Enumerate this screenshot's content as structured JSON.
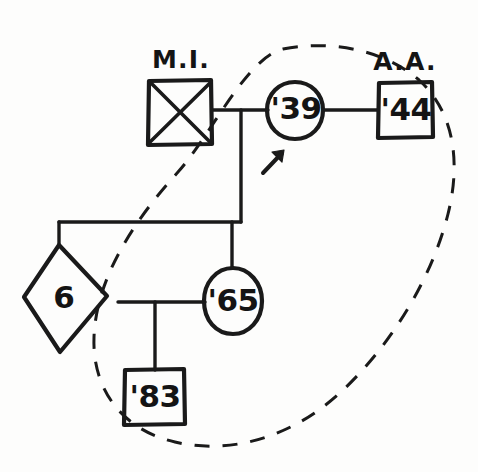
{
  "diagram": {
    "style": "hand-drawn ink on white paper",
    "background_color": "#fdfdfc",
    "ink_color": "#1a1a1a"
  },
  "individuals": [
    {
      "id": "deceased-male",
      "shape": "square",
      "sex": "male",
      "status": "deceased",
      "marker": "diagonal-cross",
      "inner_text": "",
      "annotation": "M.I.",
      "annotation_meaning": "myocardial infarction",
      "generation": 1
    },
    {
      "id": "proband-female",
      "shape": "circle",
      "sex": "female",
      "status": "living",
      "inner_text": "'39",
      "annotation": "",
      "proband": true,
      "proband_marker": "arrow",
      "generation": 1
    },
    {
      "id": "male-44",
      "shape": "square",
      "sex": "male",
      "status": "living",
      "inner_text": "'44",
      "annotation": "A.A.",
      "annotation_meaning": "alcohol abuse",
      "generation": 1
    },
    {
      "id": "unknown-sex-6",
      "shape": "diamond",
      "sex": "unknown",
      "status": "living",
      "inner_text": "6",
      "inner_text_meaning": "number of individuals represented",
      "annotation": "",
      "generation": 2
    },
    {
      "id": "female-65",
      "shape": "circle",
      "sex": "female",
      "status": "living",
      "inner_text": "'65",
      "annotation": "",
      "generation": 2
    },
    {
      "id": "male-83",
      "shape": "square",
      "sex": "male",
      "status": "living",
      "inner_text": "'83",
      "annotation": "",
      "generation": 3
    }
  ],
  "relationships": [
    {
      "id": "union-mi-39",
      "type": "mating-line",
      "partners": [
        "deceased-male",
        "proband-female"
      ]
    },
    {
      "id": "union-39-44",
      "type": "mating-line",
      "partners": [
        "proband-female",
        "male-44"
      ]
    },
    {
      "id": "sibship-gen2",
      "type": "sibship-line",
      "children": [
        "unknown-sex-6",
        "female-65"
      ]
    },
    {
      "id": "union-6-65",
      "type": "mating-line",
      "partners": [
        "unknown-sex-6",
        "female-65"
      ]
    },
    {
      "id": "descent-83",
      "type": "descent-line",
      "children": [
        "male-83"
      ]
    }
  ],
  "grouping": {
    "id": "dashed-ellipse",
    "type": "dashed-ellipse",
    "meaning": "household / affected grouping",
    "encloses": [
      "proband-female",
      "male-44",
      "female-65",
      "male-83"
    ],
    "stroke_style": "dashed"
  },
  "annotations": {
    "mi_label": "M.I.",
    "aa_label": "A.A."
  },
  "glyphs": {
    "year_39": "'39",
    "year_44": "'44",
    "year_65": "'65",
    "year_83": "'83",
    "count_6": "6"
  }
}
